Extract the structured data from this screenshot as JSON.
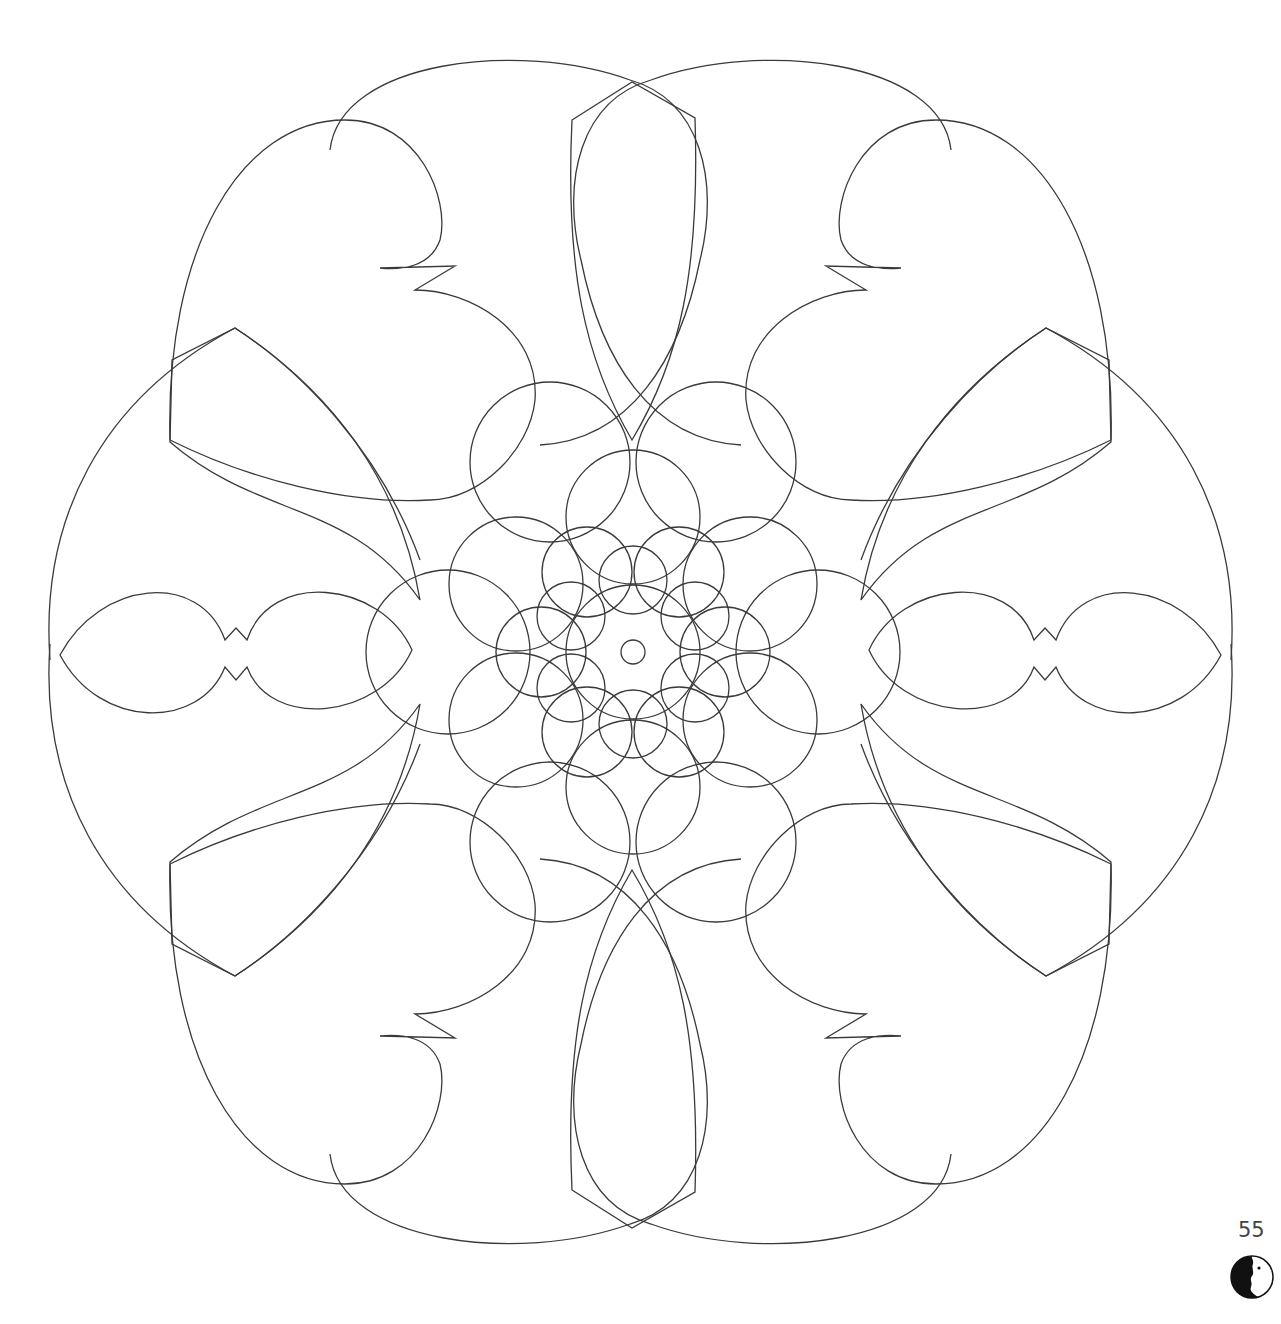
{
  "page": {
    "type": "coloring-book-page",
    "illustration": "mandala-outline",
    "page_number": "55",
    "publisher_logo": "yin-yang-face-icon"
  },
  "colors": {
    "background": "#ffffff",
    "line": "#3a3a3a"
  }
}
